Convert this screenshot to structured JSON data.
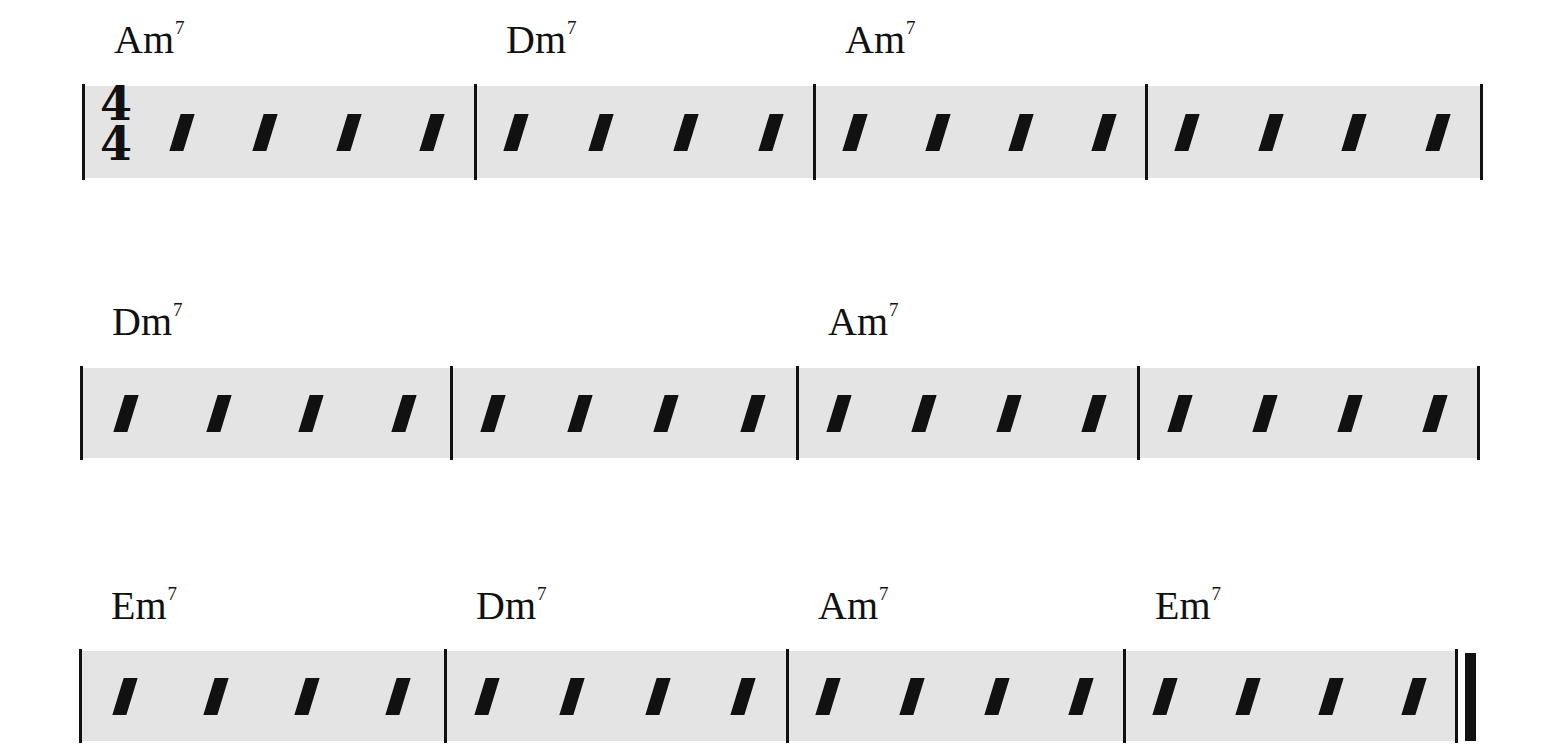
{
  "time_signature": {
    "top": "4",
    "bottom": "4"
  },
  "beats_per_measure": 4,
  "systems": [
    {
      "measures": [
        {
          "chord": {
            "root": "Am",
            "ext": "7"
          }
        },
        {
          "chord": {
            "root": "Dm",
            "ext": "7"
          }
        },
        {
          "chord": {
            "root": "Am",
            "ext": "7"
          }
        },
        {
          "chord": null
        }
      ]
    },
    {
      "measures": [
        {
          "chord": {
            "root": "Dm",
            "ext": "7"
          }
        },
        {
          "chord": null
        },
        {
          "chord": {
            "root": "Am",
            "ext": "7"
          }
        },
        {
          "chord": null
        }
      ]
    },
    {
      "measures": [
        {
          "chord": {
            "root": "Em",
            "ext": "7"
          }
        },
        {
          "chord": {
            "root": "Dm",
            "ext": "7"
          }
        },
        {
          "chord": {
            "root": "Am",
            "ext": "7"
          }
        },
        {
          "chord": {
            "root": "Em",
            "ext": "7"
          }
        }
      ],
      "final_barline": true
    }
  ]
}
